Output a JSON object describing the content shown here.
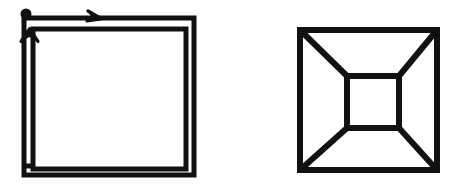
{
  "page": {
    "background_color": "#ffffff",
    "stroke_color": "#111111",
    "width": 463,
    "height": 191
  },
  "figures": [
    {
      "id": "left",
      "name": "double-square-with-direction-arrows",
      "description": "Nested double-line square outline with a start dot at the top-left corner, a rightward arrowhead on the top edge and an upward arrowhead on the left edge",
      "shape_type": "square-outline-double",
      "stroke_color": "#111111",
      "stroke_width": 5,
      "outer_square": {
        "x": 24,
        "y": 18,
        "width": 170,
        "height": 157
      },
      "inner_square": {
        "x": 33,
        "y": 29,
        "width": 153,
        "height": 140
      },
      "markers": {
        "start_dot": {
          "cx": 26,
          "cy": 14,
          "r": 5,
          "label": "start-point"
        },
        "top_arrow": {
          "x": 99,
          "y": 16,
          "direction": "right",
          "label": "top-edge-direction-arrow"
        },
        "left_arrow": {
          "x": 30,
          "y": 31,
          "direction": "up",
          "label": "left-edge-direction-arrow"
        }
      }
    },
    {
      "id": "right",
      "name": "one-point-perspective-box",
      "description": "Outer square containing a smaller centered inner square with four diagonal lines joining matching corners, forming a one-point perspective room or tunnel",
      "shape_type": "perspective-box",
      "stroke_color": "#111111",
      "stroke_width": 6,
      "outer_square": {
        "x": 68,
        "y": 30,
        "width": 137,
        "height": 140
      },
      "inner_square": {
        "x": 115,
        "y": 76,
        "width": 52,
        "height": 52
      },
      "diagonals": [
        {
          "label": "diagonal-top-left",
          "from": "outer-top-left",
          "to": "inner-top-left"
        },
        {
          "label": "diagonal-top-right",
          "from": "outer-top-right",
          "to": "inner-top-right"
        },
        {
          "label": "diagonal-bottom-right",
          "from": "outer-bottom-right",
          "to": "inner-bottom-right"
        },
        {
          "label": "diagonal-bottom-left",
          "from": "outer-bottom-left",
          "to": "inner-bottom-left"
        }
      ]
    }
  ]
}
